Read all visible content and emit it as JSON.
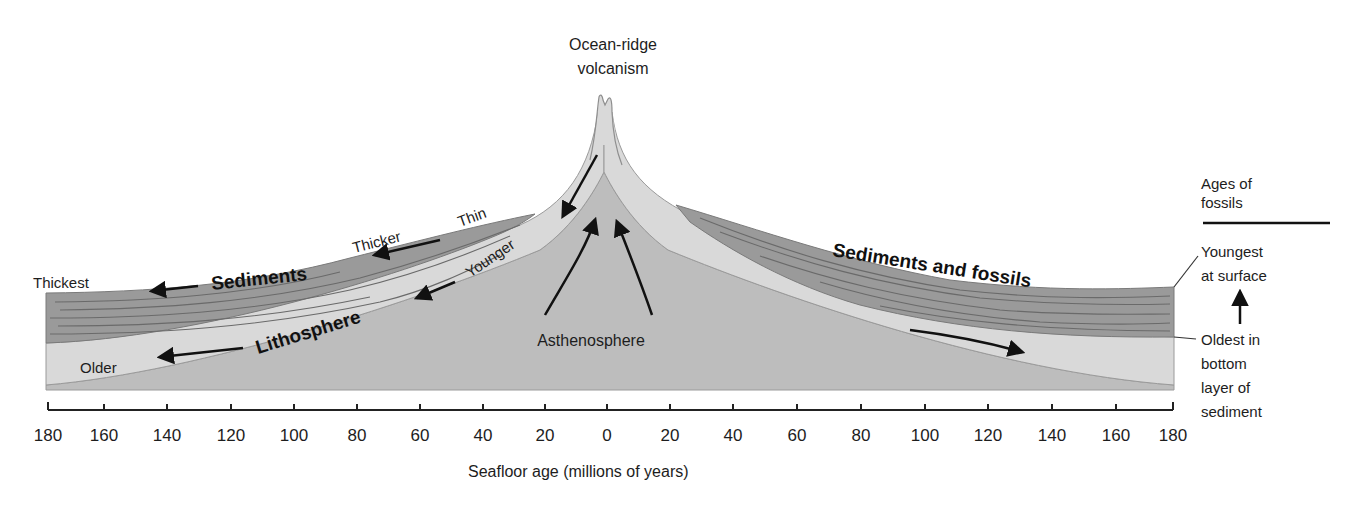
{
  "diagram": {
    "title_top": [
      "Ocean-ridge",
      "volcanism"
    ],
    "left": {
      "thickest": "Thickest",
      "thicker": "Thicker",
      "thin": "Thin",
      "sediments": "Sediments",
      "younger": "Younger",
      "lithosphere": "Lithosphere",
      "older": "Older"
    },
    "center": {
      "asthenosphere": "Asthenosphere"
    },
    "right": {
      "sediments_and_fossils": "Sediments and fossils",
      "ages_of_fossils": [
        "Ages of",
        "fossils"
      ],
      "youngest": [
        "Youngest",
        "at surface"
      ],
      "oldest": [
        "Oldest in",
        "bottom",
        "layer of",
        "sediment"
      ]
    },
    "axis": {
      "label": "Seafloor age (millions of years)",
      "ticks": [
        "180",
        "160",
        "140",
        "120",
        "100",
        "80",
        "60",
        "40",
        "20",
        "0",
        "20",
        "40",
        "60",
        "80",
        "100",
        "120",
        "140",
        "160",
        "180"
      ]
    },
    "colors": {
      "sediment": "#9a9a9a",
      "sediment_lines": "#6e6e6e",
      "lithosphere": "#d6d6d6",
      "asthenosphere": "#bdbdbd",
      "outline": "#8a8a8a",
      "text": "#1d1d1d"
    }
  }
}
